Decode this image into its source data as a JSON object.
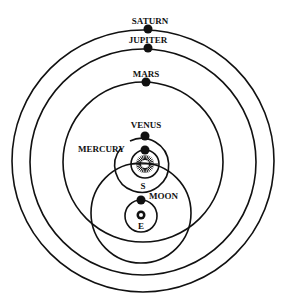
{
  "diagram": {
    "type": "geo-heliocentric (Tychonic) planetary system",
    "colors": {
      "ink": "#111111",
      "background": "#ffffff"
    },
    "bodies": [
      {
        "id": "saturn",
        "label": "SATURN",
        "orbits": "sun"
      },
      {
        "id": "jupiter",
        "label": "JUPITER",
        "orbits": "sun"
      },
      {
        "id": "mars",
        "label": "MARS",
        "orbits": "sun"
      },
      {
        "id": "venus",
        "label": "VENUS",
        "orbits": "sun"
      },
      {
        "id": "mercury",
        "label": "MERCURY",
        "orbits": "sun"
      },
      {
        "id": "sun",
        "label": "S",
        "orbits": "earth",
        "icon": "sun-icon"
      },
      {
        "id": "moon",
        "label": "MOON",
        "orbits": "earth"
      },
      {
        "id": "earth",
        "label": "E",
        "orbits": null,
        "icon": "earth-icon"
      }
    ]
  }
}
